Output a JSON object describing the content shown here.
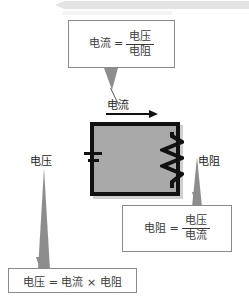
{
  "diagram": {
    "title_terms": {
      "current": "电流",
      "voltage": "电压",
      "resistance": "电阻",
      "equals": "=",
      "times": "×"
    },
    "callouts": {
      "current_formula": {
        "lhs": "电流",
        "eq": "=",
        "numerator": "电压",
        "denominator": "电阻"
      },
      "resistance_formula": {
        "lhs": "电阻",
        "eq": "=",
        "numerator": "电压",
        "denominator": "电流"
      },
      "voltage_formula": {
        "text": "电压 = 电流 × 电阻"
      }
    },
    "labels": {
      "current": "电流",
      "voltage": "电压",
      "resistance": "电阻"
    },
    "colors": {
      "circuit_fill": "#a9a9a9",
      "circuit_border": "#111111",
      "pointer_gray": "#8d8d8d",
      "box_border": "#8a8a8a",
      "text": "#1c1c1c"
    }
  }
}
